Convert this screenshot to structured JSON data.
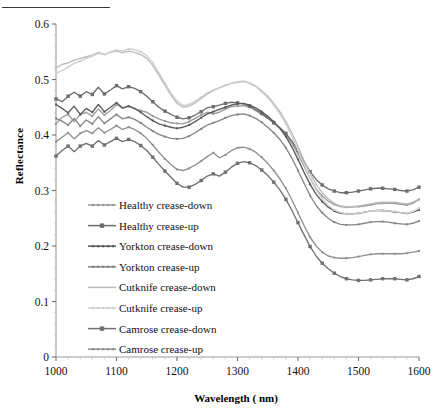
{
  "figure": {
    "has_top_rule": true,
    "background": "#ffffff"
  },
  "chart_data": {
    "type": "line",
    "title": "",
    "xlabel": "Wavelength ( nm)",
    "ylabel": "Reflectance",
    "xlim": [
      1000,
      1600
    ],
    "ylim": [
      0,
      0.6
    ],
    "xticks": [
      1000,
      1100,
      1200,
      1300,
      1400,
      1500,
      1600
    ],
    "xtick_labels": [
      "1000",
      "1100",
      "1200",
      "1300",
      "1400",
      "1500",
      "1600"
    ],
    "yticks": [
      0,
      0.1,
      0.2,
      0.3,
      0.4,
      0.5,
      0.6
    ],
    "ytick_labels": [
      "0",
      "0.1",
      "0.2",
      "0.3",
      "0.4",
      "0.5",
      "0.6"
    ],
    "grid": false,
    "legend_position": "center-left-inside",
    "x": [
      1000,
      1010,
      1020,
      1030,
      1040,
      1050,
      1060,
      1070,
      1080,
      1090,
      1100,
      1110,
      1120,
      1130,
      1140,
      1150,
      1160,
      1170,
      1180,
      1190,
      1200,
      1210,
      1220,
      1230,
      1240,
      1250,
      1260,
      1270,
      1280,
      1290,
      1300,
      1310,
      1320,
      1330,
      1340,
      1350,
      1360,
      1370,
      1380,
      1390,
      1400,
      1410,
      1420,
      1430,
      1440,
      1450,
      1460,
      1470,
      1480,
      1490,
      1500,
      1510,
      1520,
      1530,
      1540,
      1550,
      1560,
      1570,
      1580,
      1590,
      1600
    ],
    "series": [
      {
        "name": "Healthy crease-down",
        "color": "#9a9a9a",
        "marker": "small-dot",
        "values": [
          0.42,
          0.432,
          0.437,
          0.424,
          0.437,
          0.441,
          0.434,
          0.447,
          0.436,
          0.444,
          0.455,
          0.448,
          0.452,
          0.447,
          0.444,
          0.441,
          0.434,
          0.429,
          0.425,
          0.422,
          0.421,
          0.42,
          0.424,
          0.43,
          0.436,
          0.441,
          0.438,
          0.441,
          0.447,
          0.451,
          0.452,
          0.453,
          0.45,
          0.444,
          0.437,
          0.43,
          0.421,
          0.412,
          0.4,
          0.385,
          0.366,
          0.344,
          0.322,
          0.303,
          0.29,
          0.281,
          0.275,
          0.271,
          0.27,
          0.27,
          0.271,
          0.272,
          0.274,
          0.276,
          0.277,
          0.277,
          0.277,
          0.275,
          0.274,
          0.277,
          0.284
        ]
      },
      {
        "name": "Healthy crease-up",
        "color": "#6d6d6d",
        "marker": "square",
        "values": [
          0.465,
          0.46,
          0.47,
          0.477,
          0.47,
          0.478,
          0.473,
          0.486,
          0.474,
          0.481,
          0.489,
          0.483,
          0.487,
          0.484,
          0.478,
          0.47,
          0.46,
          0.45,
          0.443,
          0.437,
          0.432,
          0.429,
          0.431,
          0.436,
          0.442,
          0.449,
          0.451,
          0.454,
          0.457,
          0.459,
          0.458,
          0.456,
          0.452,
          0.446,
          0.439,
          0.431,
          0.422,
          0.413,
          0.403,
          0.389,
          0.372,
          0.352,
          0.334,
          0.32,
          0.31,
          0.303,
          0.299,
          0.296,
          0.296,
          0.297,
          0.299,
          0.301,
          0.303,
          0.304,
          0.304,
          0.303,
          0.302,
          0.3,
          0.299,
          0.301,
          0.306
        ]
      },
      {
        "name": "Yorkton crease-down",
        "color": "#5a5a5a",
        "marker": "small-dot",
        "values": [
          0.455,
          0.448,
          0.44,
          0.452,
          0.437,
          0.448,
          0.441,
          0.455,
          0.442,
          0.45,
          0.458,
          0.449,
          0.452,
          0.448,
          0.441,
          0.433,
          0.426,
          0.42,
          0.417,
          0.414,
          0.412,
          0.414,
          0.418,
          0.424,
          0.431,
          0.438,
          0.442,
          0.446,
          0.45,
          0.454,
          0.456,
          0.457,
          0.454,
          0.449,
          0.442,
          0.434,
          0.424,
          0.412,
          0.397,
          0.378,
          0.356,
          0.333,
          0.311,
          0.293,
          0.28,
          0.27,
          0.263,
          0.259,
          0.258,
          0.258,
          0.259,
          0.261,
          0.263,
          0.264,
          0.264,
          0.263,
          0.261,
          0.26,
          0.259,
          0.261,
          0.265
        ]
      },
      {
        "name": "Yorkton crease-up",
        "color": "#858585",
        "marker": "small-dot",
        "values": [
          0.43,
          0.425,
          0.418,
          0.43,
          0.416,
          0.427,
          0.42,
          0.433,
          0.421,
          0.429,
          0.437,
          0.429,
          0.432,
          0.428,
          0.422,
          0.414,
          0.407,
          0.401,
          0.397,
          0.394,
          0.393,
          0.394,
          0.398,
          0.404,
          0.411,
          0.418,
          0.422,
          0.426,
          0.431,
          0.435,
          0.437,
          0.438,
          0.435,
          0.43,
          0.423,
          0.414,
          0.404,
          0.392,
          0.377,
          0.358,
          0.336,
          0.313,
          0.291,
          0.273,
          0.26,
          0.25,
          0.243,
          0.239,
          0.238,
          0.238,
          0.239,
          0.241,
          0.243,
          0.244,
          0.244,
          0.243,
          0.241,
          0.24,
          0.239,
          0.241,
          0.245
        ]
      },
      {
        "name": "Cutknife crease-down",
        "color": "#bcbcbc",
        "marker": "none",
        "values": [
          0.521,
          0.527,
          0.53,
          0.535,
          0.538,
          0.541,
          0.544,
          0.549,
          0.545,
          0.549,
          0.551,
          0.548,
          0.551,
          0.549,
          0.545,
          0.538,
          0.525,
          0.508,
          0.49,
          0.472,
          0.457,
          0.45,
          0.452,
          0.458,
          0.466,
          0.474,
          0.48,
          0.485,
          0.489,
          0.493,
          0.496,
          0.497,
          0.494,
          0.488,
          0.48,
          0.47,
          0.457,
          0.442,
          0.424,
          0.403,
          0.379,
          0.354,
          0.331,
          0.311,
          0.296,
          0.285,
          0.277,
          0.272,
          0.271,
          0.271,
          0.272,
          0.274,
          0.276,
          0.278,
          0.279,
          0.279,
          0.279,
          0.277,
          0.276,
          0.279,
          0.285
        ]
      },
      {
        "name": "Cutknife crease-up",
        "color": "#cfcfcf",
        "marker": "small-dot",
        "values": [
          0.511,
          0.516,
          0.522,
          0.529,
          0.533,
          0.538,
          0.542,
          0.547,
          0.545,
          0.55,
          0.553,
          0.551,
          0.555,
          0.554,
          0.55,
          0.543,
          0.53,
          0.512,
          0.494,
          0.476,
          0.461,
          0.453,
          0.455,
          0.461,
          0.468,
          0.476,
          0.481,
          0.486,
          0.49,
          0.493,
          0.495,
          0.496,
          0.493,
          0.487,
          0.478,
          0.467,
          0.454,
          0.438,
          0.42,
          0.398,
          0.373,
          0.347,
          0.322,
          0.301,
          0.285,
          0.273,
          0.265,
          0.26,
          0.258,
          0.258,
          0.259,
          0.261,
          0.263,
          0.264,
          0.264,
          0.263,
          0.262,
          0.26,
          0.259,
          0.262,
          0.268
        ]
      },
      {
        "name": "Camrose crease-down",
        "color": "#707070",
        "marker": "square",
        "values": [
          0.362,
          0.372,
          0.38,
          0.37,
          0.38,
          0.385,
          0.38,
          0.39,
          0.382,
          0.388,
          0.394,
          0.388,
          0.392,
          0.388,
          0.381,
          0.372,
          0.36,
          0.347,
          0.335,
          0.324,
          0.313,
          0.306,
          0.306,
          0.311,
          0.318,
          0.326,
          0.33,
          0.326,
          0.333,
          0.342,
          0.349,
          0.352,
          0.35,
          0.345,
          0.337,
          0.327,
          0.315,
          0.301,
          0.284,
          0.264,
          0.242,
          0.22,
          0.199,
          0.182,
          0.169,
          0.159,
          0.151,
          0.145,
          0.141,
          0.139,
          0.138,
          0.138,
          0.139,
          0.14,
          0.141,
          0.141,
          0.141,
          0.14,
          0.139,
          0.141,
          0.145
        ]
      },
      {
        "name": "Camrose crease-up",
        "color": "#8f8f8f",
        "marker": "small-dot",
        "values": [
          0.388,
          0.396,
          0.404,
          0.393,
          0.403,
          0.408,
          0.403,
          0.413,
          0.404,
          0.41,
          0.417,
          0.41,
          0.414,
          0.41,
          0.403,
          0.394,
          0.382,
          0.369,
          0.357,
          0.347,
          0.338,
          0.336,
          0.34,
          0.346,
          0.353,
          0.361,
          0.368,
          0.359,
          0.364,
          0.372,
          0.377,
          0.378,
          0.375,
          0.369,
          0.36,
          0.349,
          0.336,
          0.321,
          0.304,
          0.283,
          0.26,
          0.237,
          0.216,
          0.2,
          0.189,
          0.182,
          0.179,
          0.178,
          0.178,
          0.179,
          0.181,
          0.183,
          0.185,
          0.186,
          0.186,
          0.186,
          0.186,
          0.186,
          0.187,
          0.189,
          0.191
        ]
      }
    ]
  }
}
